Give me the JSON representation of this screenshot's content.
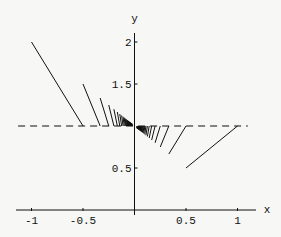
{
  "chart_data": {
    "type": "line",
    "title": "",
    "xlabel": "x",
    "ylabel": "y",
    "xlim": [
      -1.1,
      1.1
    ],
    "ylim": [
      0,
      2.1
    ],
    "grid": false,
    "x_ticks": [
      {
        "v": -1,
        "label": "-1"
      },
      {
        "v": -0.5,
        "label": "-0.5"
      },
      {
        "v": 0.5,
        "label": "0.5"
      },
      {
        "v": 1,
        "label": "1"
      }
    ],
    "y_ticks": [
      {
        "v": 0.5,
        "label": "0.5"
      },
      {
        "v": 1.5,
        "label": "1.5"
      },
      {
        "v": 2,
        "label": "2"
      }
    ],
    "reference_line": {
      "y": 1,
      "style": "dashed",
      "x_from": -1.13,
      "x_to": 1.1
    },
    "segments_left": {
      "description": "segments from (-1/n, 1+1/n) to (-1/(n+1), 1)",
      "n_from": 1,
      "n_to": 40
    },
    "segments_right": {
      "description": "segments from (1/n, 1-1/n) to (1/(n-1), 1)",
      "n_from": 2,
      "n_to": 40
    },
    "color": "#111111"
  }
}
